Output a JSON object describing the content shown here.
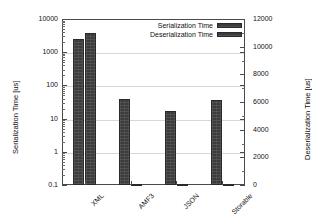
{
  "chart_data": {
    "type": "bar",
    "title": "",
    "categories": [
      "XML",
      "AMF3",
      "JSON",
      "Storable"
    ],
    "series": [
      {
        "name": "Serialization Time",
        "axis": "left",
        "values": [
          2500,
          38,
          17,
          36
        ]
      },
      {
        "name": "Deserialization Time",
        "axis": "right",
        "values": [
          11000,
          60,
          50,
          40
        ]
      }
    ],
    "xlabel": "",
    "ylabel": "Serialization Time [us]",
    "y2label": "Deserialization Time [us]",
    "yscale": "log",
    "ylim": [
      0.1,
      10000
    ],
    "y2lim": [
      0,
      12000
    ],
    "yticks": [
      "0.1",
      "1",
      "10",
      "100",
      "1000",
      "10000"
    ],
    "y2ticks": [
      "0",
      "2000",
      "4000",
      "6000",
      "8000",
      "10000",
      "12000"
    ],
    "grid": true,
    "legend_position": "top-right",
    "legend": [
      "Serialization Time",
      "Deserialization Time"
    ],
    "bar_color": "#3c3c3c",
    "grid_color": "#d8d8d8",
    "frame_color": "#4a4a4a",
    "background": "#ffffff"
  },
  "axes": {
    "left_title": "Serialization Time [us]",
    "right_title": "Deserialization Time [us]"
  },
  "legend": {
    "items": [
      {
        "label": "Serialization Time"
      },
      {
        "label": "Deserialization Time"
      }
    ]
  }
}
